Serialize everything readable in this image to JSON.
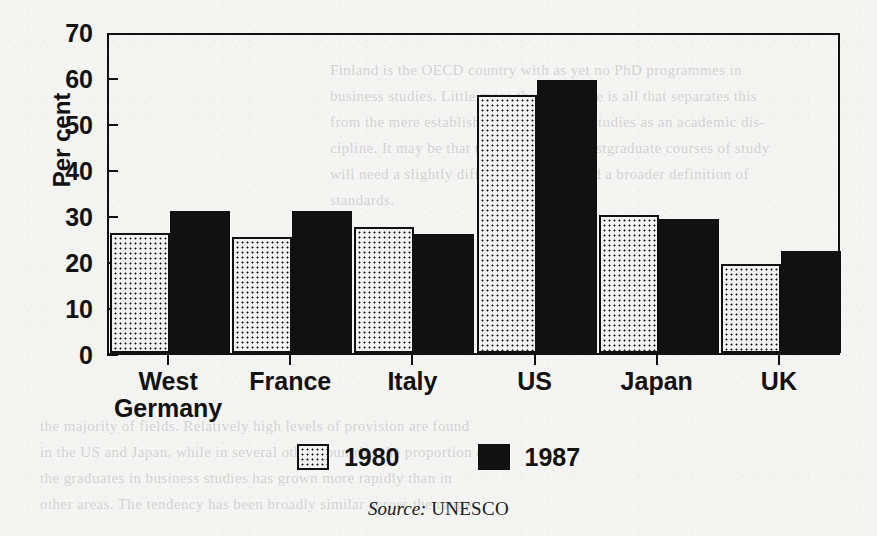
{
  "chart_data": {
    "type": "bar",
    "title": "",
    "subtitle": "",
    "xlabel": "",
    "ylabel": "Per cent",
    "ylim": [
      0,
      70
    ],
    "ytick_step": 10,
    "yticks": [
      0,
      10,
      20,
      30,
      40,
      50,
      60,
      70
    ],
    "grid": false,
    "legend_position": "bottom",
    "categories": [
      "West\nGermany",
      "France",
      "Italy",
      "US",
      "Japan",
      "UK"
    ],
    "category_labels_flat": [
      "West Germany",
      "France",
      "Italy",
      "US",
      "Japan",
      "UK"
    ],
    "series": [
      {
        "name": "1980",
        "fill": "dotted",
        "values": [
          26.0,
          25.3,
          27.5,
          56.0,
          30.1,
          19.3
        ]
      },
      {
        "name": "1987",
        "fill": "solid",
        "values": [
          30.8,
          30.8,
          25.8,
          59.4,
          29.2,
          22.2
        ]
      }
    ],
    "source_prefix": "Source:",
    "source_name": "UNESCO",
    "colors": {
      "ink": "#111111",
      "paper": "#f4f4f2",
      "bar_1980_fill": "#f2f2f0",
      "bar_1987_fill": "#111111"
    }
  },
  "ghost_text": {
    "lines": [
      "Finland is the OECD country with as yet no PhD programmes in",
      "business studies. Little more than a decade is all that separates this",
      "from the mere establishment of business studies as an academic dis-",
      "cipline. It may be that the provision of postgraduate courses of study",
      "will need a slightly different approach and a broader definition of",
      "standards."
    ],
    "lower_lines": [
      "the majority of fields. Relatively  high levels of  provision  are found",
      "in the US and Japan, while in several other countries the proportion of",
      "the graduates in business studies has grown more rapidly than in",
      "other areas. The tendency has been broadly similar across the range"
    ]
  }
}
